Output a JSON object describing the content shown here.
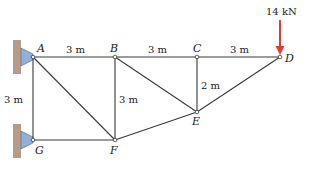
{
  "diagram": {
    "type": "truss",
    "joints": [
      {
        "id": "A",
        "label": "A",
        "x": 33,
        "y": 57
      },
      {
        "id": "B",
        "label": "B",
        "x": 115,
        "y": 57
      },
      {
        "id": "C",
        "label": "C",
        "x": 197,
        "y": 57
      },
      {
        "id": "D",
        "label": "D",
        "x": 280,
        "y": 57
      },
      {
        "id": "E",
        "label": "E",
        "x": 197,
        "y": 112
      },
      {
        "id": "F",
        "label": "F",
        "x": 115,
        "y": 140
      },
      {
        "id": "G",
        "label": "G",
        "x": 33,
        "y": 140
      }
    ],
    "members": [
      [
        "A",
        "B"
      ],
      [
        "B",
        "C"
      ],
      [
        "C",
        "D"
      ],
      [
        "A",
        "G"
      ],
      [
        "G",
        "F"
      ],
      [
        "A",
        "F"
      ],
      [
        "B",
        "F"
      ],
      [
        "B",
        "E"
      ],
      [
        "C",
        "E"
      ],
      [
        "F",
        "E"
      ],
      [
        "E",
        "D"
      ]
    ],
    "dimensions": {
      "ab": "3 m",
      "bc": "3 m",
      "cd": "3 m",
      "ag": "3 m",
      "bf": "3 m",
      "ce": "2 m"
    },
    "load": {
      "value": "14 kN",
      "joint": "D",
      "direction": "down"
    },
    "supports": [
      {
        "joint": "A",
        "type": "pin",
        "wall": "left"
      },
      {
        "joint": "G",
        "type": "pin",
        "wall": "left"
      }
    ],
    "colors": {
      "member": "#3a3a3a",
      "load_arrow": "#e03a3a",
      "support": "#8fb0d8",
      "wall": "#b89a8a"
    }
  }
}
